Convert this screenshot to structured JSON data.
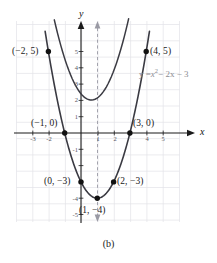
{
  "caption": "(b)",
  "axes": {
    "x_name": "x",
    "y_name": "y",
    "x_ticks": [
      {
        "value": -3,
        "label": "-3"
      },
      {
        "value": -2,
        "label": "-2"
      },
      {
        "value": 1,
        "label": "1"
      },
      {
        "value": 2,
        "label": "2"
      },
      {
        "value": 4,
        "label": "4"
      },
      {
        "value": 5,
        "label": "5"
      }
    ],
    "y_ticks": [
      {
        "value": 5,
        "label": "5"
      },
      {
        "value": 4,
        "label": "4"
      },
      {
        "value": 3,
        "label": "3"
      },
      {
        "value": 2,
        "label": "2"
      },
      {
        "value": 1,
        "label": "1"
      },
      {
        "value": -1,
        "label": "-1"
      },
      {
        "value": -4,
        "label": "-4"
      },
      {
        "value": -5,
        "label": "-5"
      }
    ]
  },
  "equation": {
    "lhs": "y =",
    "term1_base": "x",
    "term1_exp": "2",
    "rest": "− 2x − 3",
    "full": "y = x² − 2x − 3",
    "color": "#8c8c92"
  },
  "labels": {
    "p_left_vertexpt": "(−2, 5)",
    "p_right_top": "(4, 5)",
    "p_root_left": "(−1, 0)",
    "p_root_right": "(3, 0)",
    "p_yint": "(0, −3)",
    "p_mirror": "(2, −3)",
    "p_vertex": "(1, −4)"
  },
  "chart_data": {
    "type": "line",
    "title": "",
    "subtitle": "",
    "xlabel": "x",
    "ylabel": "y",
    "xlim": [
      -3.6,
      5.5
    ],
    "ylim": [
      -5.6,
      6.2
    ],
    "grid": true,
    "grid_step": 1,
    "legend": "none",
    "annotations": [
      {
        "text": "y = x² − 2x − 3",
        "x": 3.0,
        "y": 3.2,
        "color": "#8c8c92"
      },
      {
        "text": "axis of symmetry x = 1",
        "type": "dashed-vertical",
        "x": 1
      }
    ],
    "series": [
      {
        "name": "y = x^2 - 2x - 3",
        "type": "parabola",
        "color": "#3a3a42",
        "vertex": [
          1,
          -4
        ],
        "a": 1,
        "x": [
          -2.0,
          -1.75,
          -1.5,
          -1.25,
          -1.0,
          -0.75,
          -0.5,
          -0.25,
          0.0,
          0.25,
          0.5,
          0.75,
          1.0,
          1.25,
          1.5,
          1.75,
          2.0,
          2.25,
          2.5,
          2.75,
          3.0,
          3.25,
          3.5,
          3.75,
          4.0
        ],
        "values": [
          5.0,
          3.5625,
          2.25,
          1.0625,
          0.0,
          -0.9375,
          -1.75,
          -2.4375,
          -3.0,
          -3.4375,
          -3.75,
          -3.9375,
          -4.0,
          -3.9375,
          -3.75,
          -3.4375,
          -3.0,
          -2.4375,
          -1.75,
          -0.9375,
          0.0,
          1.0625,
          2.25,
          3.5625,
          5.0
        ]
      }
    ],
    "points": [
      {
        "x": -2,
        "y": 5,
        "label": "(−2, 5)",
        "label_pos": "left"
      },
      {
        "x": 4,
        "y": 5,
        "label": "(4, 5)",
        "label_pos": "right"
      },
      {
        "x": -1,
        "y": 0,
        "label": "(−1, 0)",
        "label_pos": "above-left"
      },
      {
        "x": 3,
        "y": 0,
        "label": "(3, 0)",
        "label_pos": "above-right"
      },
      {
        "x": 0,
        "y": -3,
        "label": "(0, −3)",
        "label_pos": "left"
      },
      {
        "x": 2,
        "y": -3,
        "label": "(2, −3)",
        "label_pos": "right"
      },
      {
        "x": 1,
        "y": -4,
        "label": "(1, −4)",
        "label_pos": "below"
      }
    ]
  }
}
